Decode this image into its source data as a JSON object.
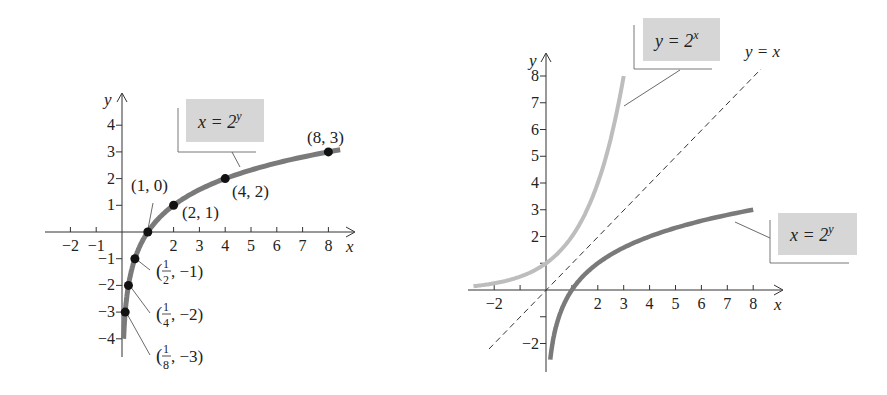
{
  "chart_data": [
    {
      "type": "line",
      "title": "",
      "xlabel": "x",
      "ylabel": "y",
      "xlim": [
        -2.5,
        9
      ],
      "ylim": [
        -4.5,
        5
      ],
      "x_ticks": [
        "−2",
        "−1",
        "2",
        "3",
        "4",
        "5",
        "6",
        "7",
        "8"
      ],
      "y_ticks": [
        "4",
        "3",
        "2",
        "1",
        "−1",
        "−2",
        "−3",
        "−4"
      ],
      "series": [
        {
          "name": "x = 2^y",
          "function": "x = 2^y",
          "color": "#7a7a7a",
          "points": [
            {
              "x": 0.125,
              "y": -3,
              "label": "(1/8, −3)"
            },
            {
              "x": 0.25,
              "y": -2,
              "label": "(1/4, −2)"
            },
            {
              "x": 0.5,
              "y": -1,
              "label": "(1/2, −1)"
            },
            {
              "x": 1,
              "y": 0,
              "label": "(1, 0)"
            },
            {
              "x": 2,
              "y": 1,
              "label": "(2, 1)"
            },
            {
              "x": 4,
              "y": 2,
              "label": "(4, 2)"
            },
            {
              "x": 8,
              "y": 3,
              "label": "(8, 3)"
            }
          ]
        }
      ],
      "annotations": [
        "x = 2^y"
      ]
    },
    {
      "type": "line",
      "title": "",
      "xlabel": "x",
      "ylabel": "y",
      "xlim": [
        -3,
        9
      ],
      "ylim": [
        -3,
        9
      ],
      "x_ticks": [
        "−2",
        "2",
        "3",
        "4",
        "5",
        "6",
        "7",
        "8"
      ],
      "y_ticks": [
        "8",
        "7",
        "6",
        "5",
        "4",
        "3",
        "2",
        "−2"
      ],
      "series": [
        {
          "name": "y = 2^x",
          "function": "y = 2^x",
          "color": "#bdbdbd",
          "x_range": [
            -2.8,
            3
          ]
        },
        {
          "name": "x = 2^y",
          "function": "x = 2^y",
          "color": "#7a7a7a",
          "y_range": [
            -2.6,
            3
          ]
        },
        {
          "name": "y = x",
          "function": "y = x",
          "color": "#333333",
          "style": "dashed",
          "x_range": [
            -2.2,
            8.3
          ]
        }
      ],
      "annotations": [
        "y = 2^x",
        "x = 2^y",
        "y = x"
      ]
    }
  ],
  "left": {
    "axis_x": "x",
    "axis_y": "y",
    "xticks": [
      {
        "v": -2,
        "l": "−2"
      },
      {
        "v": -1,
        "l": "−1"
      },
      {
        "v": 2,
        "l": "2"
      },
      {
        "v": 3,
        "l": "3"
      },
      {
        "v": 4,
        "l": "4"
      },
      {
        "v": 5,
        "l": "5"
      },
      {
        "v": 6,
        "l": "6"
      },
      {
        "v": 7,
        "l": "7"
      },
      {
        "v": 8,
        "l": "8"
      }
    ],
    "yticks": [
      {
        "v": 4,
        "l": "4"
      },
      {
        "v": 3,
        "l": "3"
      },
      {
        "v": 2,
        "l": "2"
      },
      {
        "v": 1,
        "l": "1"
      },
      {
        "v": -1,
        "l": "−1"
      },
      {
        "v": -2,
        "l": "−2"
      },
      {
        "v": -3,
        "l": "−3"
      },
      {
        "v": -4,
        "l": "−4"
      }
    ],
    "eq": {
      "lhs": "x = 2",
      "sup": "y"
    },
    "labels": {
      "p10": "(1, 0)",
      "p21": "(2, 1)",
      "p42": "(4, 2)",
      "p83": "(8, 3)",
      "half": {
        "num": "1",
        "den": "2",
        "rest": ", −1)"
      },
      "quarter": {
        "num": "1",
        "den": "4",
        "rest": ", −2)"
      },
      "eighth": {
        "num": "1",
        "den": "8",
        "rest": ", −3)"
      },
      "open": "("
    }
  },
  "right": {
    "axis_x": "x",
    "axis_y": "y",
    "xticks": [
      {
        "v": -2,
        "l": "−2"
      },
      {
        "v": 2,
        "l": "2"
      },
      {
        "v": 3,
        "l": "3"
      },
      {
        "v": 4,
        "l": "4"
      },
      {
        "v": 5,
        "l": "5"
      },
      {
        "v": 6,
        "l": "6"
      },
      {
        "v": 7,
        "l": "7"
      },
      {
        "v": 8,
        "l": "8"
      }
    ],
    "yticks": [
      {
        "v": 8,
        "l": "8"
      },
      {
        "v": 7,
        "l": "7"
      },
      {
        "v": 6,
        "l": "6"
      },
      {
        "v": 5,
        "l": "5"
      },
      {
        "v": 4,
        "l": "4"
      },
      {
        "v": 3,
        "l": "3"
      },
      {
        "v": 2,
        "l": "2"
      },
      {
        "v": -2,
        "l": "−2"
      }
    ],
    "eq_exp": {
      "lhs": "y = 2",
      "sup": "x"
    },
    "eq_log": {
      "lhs": "x = 2",
      "sup": "y"
    },
    "eq_id": "y = x"
  }
}
